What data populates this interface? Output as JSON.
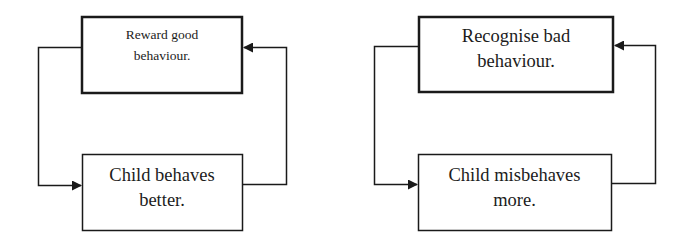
{
  "diagrams": [
    {
      "name": "positive-cycle",
      "top_box": {
        "line1": "Reward good",
        "line2": "behaviour."
      },
      "bottom_box": {
        "line1": "Child behaves",
        "line2": "better."
      }
    },
    {
      "name": "negative-cycle",
      "top_box": {
        "line1": "Recognise bad",
        "line2": "behaviour."
      },
      "bottom_box": {
        "line1": "Child misbehaves",
        "line2": "more."
      }
    }
  ],
  "colors": {
    "stroke": "#1a1a1a",
    "text": "#1c1c1c",
    "background": "#ffffff"
  }
}
